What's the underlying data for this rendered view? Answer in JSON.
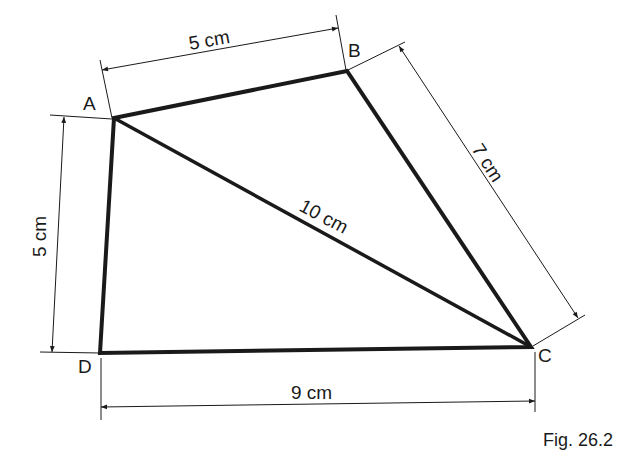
{
  "figure": {
    "caption": "Fig. 26.2",
    "vertices": {
      "A": {
        "label": "A",
        "x": 114,
        "y": 118
      },
      "B": {
        "label": "B",
        "x": 347,
        "y": 71
      },
      "C": {
        "label": "C",
        "x": 531,
        "y": 347
      },
      "D": {
        "label": "D",
        "x": 100,
        "y": 353
      }
    },
    "measurements": {
      "AB": "5 cm",
      "BC": "7 cm",
      "AC": "10 cm",
      "AD": "5 cm",
      "DC": "9 cm"
    },
    "colors": {
      "line": "#1a1a1a",
      "background": "#ffffff"
    }
  }
}
